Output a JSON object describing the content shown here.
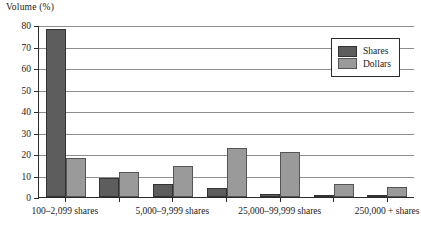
{
  "chart_data": {
    "type": "bar",
    "title": "",
    "ylabel": "Volume (%)",
    "xlabel": "",
    "ylim": [
      0,
      80
    ],
    "yticks": [
      0,
      10,
      20,
      30,
      40,
      50,
      60,
      70,
      80
    ],
    "grid": true,
    "legend_position": "top-right",
    "categories": [
      "100–2,099 shares",
      "",
      "5,000–9,999 shares",
      "",
      "25,000–99,999 shares",
      "",
      "250,000 + shares"
    ],
    "visible_tick_labels": [
      "100–2,099 shares",
      "5,000–9,999 shares",
      "25,000–99,999 shares",
      "250,000 + shares"
    ],
    "series": [
      {
        "name": "Shares",
        "color": "#5d5d5d",
        "values": [
          78,
          9,
          6,
          4,
          1.5,
          1,
          0.8
        ]
      },
      {
        "name": "Dollars",
        "color": "#9a9a9a",
        "values": [
          18,
          11.5,
          14.5,
          23,
          21,
          6,
          4.5
        ]
      }
    ]
  },
  "legend": {
    "items": [
      {
        "label": "Shares",
        "swatch": "shares-swatch"
      },
      {
        "label": "Dollars",
        "swatch": "dollars-swatch"
      }
    ]
  }
}
